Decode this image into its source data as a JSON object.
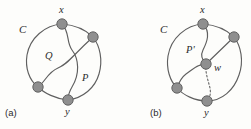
{
  "figure": {
    "background_color": "#fdfdfb",
    "stroke_color": "#5f5f5f",
    "vertex_fill": "#8f8f8f",
    "vertex_stroke": "#5a5a5a",
    "panels": [
      {
        "id": "panel-a",
        "caption": "(a)",
        "cycle_label": "C",
        "labels": [
          {
            "name": "vertex-label-x",
            "text": "x"
          },
          {
            "name": "vertex-label-y",
            "text": "y"
          },
          {
            "name": "path-label-Q",
            "text": "Q"
          },
          {
            "name": "path-label-P",
            "text": "P"
          }
        ],
        "vertices": [
          {
            "name": "vertex-x",
            "label": "x",
            "cx": 62,
            "cy": 24,
            "r": 5.2
          },
          {
            "name": "vertex-right",
            "label": "",
            "cx": 93,
            "cy": 37,
            "r": 5.2
          },
          {
            "name": "vertex-left",
            "label": "",
            "cx": 38,
            "cy": 87,
            "r": 5.2
          },
          {
            "name": "vertex-y",
            "label": "y",
            "cx": 68,
            "cy": 100,
            "r": 5.2
          }
        ]
      },
      {
        "id": "panel-b",
        "caption": "(b)",
        "cycle_label": "C",
        "labels": [
          {
            "name": "vertex-label-x",
            "text": "x"
          },
          {
            "name": "vertex-label-y",
            "text": "y"
          },
          {
            "name": "vertex-label-w",
            "text": "w"
          },
          {
            "name": "path-label-P-prime",
            "text": "P'"
          }
        ],
        "vertices": [
          {
            "name": "vertex-x",
            "label": "x",
            "cx": 203,
            "cy": 24,
            "r": 5.2
          },
          {
            "name": "vertex-right",
            "label": "",
            "cx": 234,
            "cy": 37,
            "r": 5.2
          },
          {
            "name": "vertex-w",
            "label": "w",
            "cx": 206,
            "cy": 64,
            "r": 5.2
          },
          {
            "name": "vertex-left",
            "label": "",
            "cx": 177,
            "cy": 88,
            "r": 5.2
          },
          {
            "name": "vertex-y",
            "label": "y",
            "cx": 207,
            "cy": 101,
            "r": 5.2
          }
        ]
      }
    ],
    "text": {
      "caption_a": "(a)",
      "caption_b": "(b)",
      "label_C_a": "C",
      "label_C_b": "C",
      "label_x_a": "x",
      "label_y_a": "y",
      "label_Q": "Q",
      "label_P": "P",
      "label_x_b": "x",
      "label_y_b": "y",
      "label_w": "w",
      "label_P_prime": "P'"
    }
  }
}
